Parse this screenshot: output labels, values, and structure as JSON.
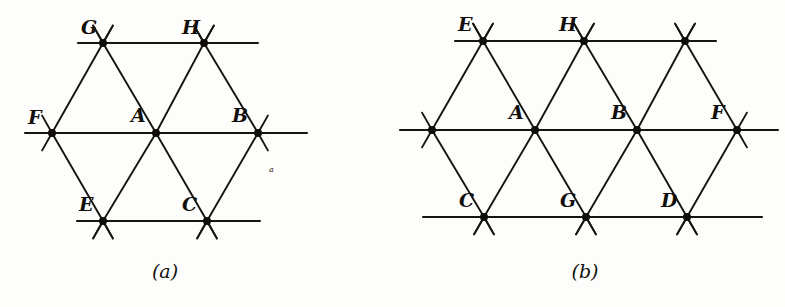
{
  "figure": {
    "kind": "line-drawing",
    "background_color": "#fdfdfb",
    "ink_color": "#16140f",
    "panels": [
      {
        "id": "a",
        "caption": "(a)",
        "caption_x": 165,
        "caption_y": 278,
        "lattice": {
          "spacing_x": 102,
          "spacing_y": 89,
          "stub_length": 20
        },
        "rows": [
          {
            "y": 43,
            "line_x1": 78,
            "line_x2": 258,
            "nodes": [
              {
                "label": "G",
                "x": 103,
                "y": 43,
                "label_dx": -22,
                "label_dy": -9
              },
              {
                "label": "H",
                "x": 204,
                "y": 43,
                "label_dx": -22,
                "label_dy": -9
              }
            ]
          },
          {
            "y": 133,
            "line_x1": 25,
            "line_x2": 307,
            "nodes": [
              {
                "label": "F",
                "x": 52,
                "y": 133,
                "label_dx": -24,
                "label_dy": -9
              },
              {
                "label": "A",
                "x": 156,
                "y": 133,
                "label_dx": -25,
                "label_dy": -11
              },
              {
                "label": "B",
                "x": 258,
                "y": 133,
                "label_dx": -26,
                "label_dy": -11
              }
            ]
          },
          {
            "y": 221,
            "line_x1": 77,
            "line_x2": 260,
            "nodes": [
              {
                "label": "E",
                "x": 103,
                "y": 221,
                "label_dx": -24,
                "label_dy": -10
              },
              {
                "label": "C",
                "x": 207,
                "y": 221,
                "label_dx": -25,
                "label_dy": -10
              }
            ]
          }
        ],
        "annotations": [
          {
            "text": "a",
            "x": 269,
            "y": 172
          }
        ]
      },
      {
        "id": "b",
        "caption": "(b)",
        "caption_x": 585,
        "caption_y": 278,
        "lattice": {
          "spacing_x": 102,
          "spacing_y": 88,
          "stub_length": 20
        },
        "rows": [
          {
            "y": 41,
            "line_x1": 455,
            "line_x2": 716,
            "nodes": [
              {
                "label": "E",
                "x": 483,
                "y": 41,
                "label_dx": -25,
                "label_dy": -10
              },
              {
                "label": "H",
                "x": 584,
                "y": 41,
                "label_dx": -25,
                "label_dy": -10
              },
              {
                "label": "",
                "x": 685,
                "y": 41,
                "label_dx": 0,
                "label_dy": 0
              }
            ]
          },
          {
            "y": 130,
            "line_x1": 400,
            "line_x2": 778,
            "nodes": [
              {
                "label": "",
                "x": 432,
                "y": 130,
                "label_dx": 0,
                "label_dy": 0
              },
              {
                "label": "A",
                "x": 535,
                "y": 130,
                "label_dx": -26,
                "label_dy": -11
              },
              {
                "label": "B",
                "x": 637,
                "y": 130,
                "label_dx": -26,
                "label_dy": -11
              },
              {
                "label": "F",
                "x": 737,
                "y": 130,
                "label_dx": -26,
                "label_dy": -11
              }
            ]
          },
          {
            "y": 217,
            "line_x1": 423,
            "line_x2": 762,
            "nodes": [
              {
                "label": "C",
                "x": 484,
                "y": 217,
                "label_dx": -25,
                "label_dy": -10
              },
              {
                "label": "G",
                "x": 586,
                "y": 217,
                "label_dx": -26,
                "label_dy": -10
              },
              {
                "label": "D",
                "x": 687,
                "y": 217,
                "label_dx": -26,
                "label_dy": -10
              }
            ]
          }
        ],
        "annotations": []
      }
    ]
  }
}
